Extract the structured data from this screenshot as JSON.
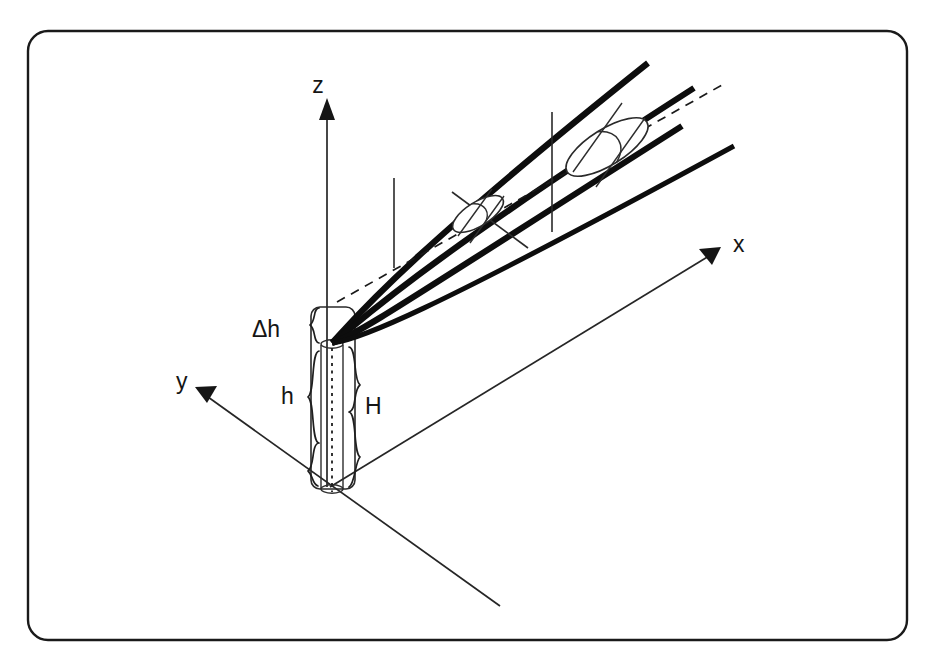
{
  "figure": {
    "background_color": "#ffffff",
    "ink_color": "#151515",
    "frame": {
      "shape": "rounded-rectangle",
      "x": 28,
      "y": 31,
      "width": 879,
      "height": 609,
      "corner_radius": 20
    },
    "axes": [
      {
        "id": "z",
        "label": "z",
        "label_x": 318,
        "label_y": 93,
        "direction": "up",
        "from": [
          327,
          487
        ],
        "to": [
          327,
          104
        ],
        "arrowhead": [
          327,
          99
        ]
      },
      {
        "id": "x",
        "label": "x",
        "label_x": 733,
        "label_y": 252,
        "direction": "up-right",
        "from": [
          330,
          487
        ],
        "to": [
          712,
          254
        ],
        "arrowhead": [
          718,
          250
        ]
      },
      {
        "id": "y",
        "label": "y",
        "label_x": 176,
        "label_y": 389,
        "direction": "up-left",
        "from": [
          500,
          606
        ],
        "to": [
          204,
          394
        ],
        "arrowhead": [
          197,
          389
        ]
      }
    ],
    "dimensions": [
      {
        "id": "delta-h",
        "label": "Δh",
        "label_x": 252,
        "label_y": 337,
        "brace_side": "left",
        "brace_x": 312,
        "span_top": 308,
        "span_bottom": 344,
        "meaning": "height increment above nozzle exit"
      },
      {
        "id": "h",
        "label": "h",
        "label_x": 281,
        "label_y": 404,
        "brace_side": "left",
        "brace_x": 312,
        "span_top": 350,
        "span_bottom": 486,
        "meaning": "lower column height"
      },
      {
        "id": "H",
        "label": "H",
        "label_x": 365,
        "label_y": 414,
        "brace_side": "right",
        "brace_x": 356,
        "span_top": 346,
        "span_bottom": 486,
        "meaning": "total column height"
      }
    ],
    "column": {
      "name": "vertical cylinder",
      "outer_left": 311,
      "outer_right": 355,
      "outer_top": 307,
      "outer_bottom": 489,
      "inner_left": 321,
      "inner_right": 343,
      "inner_top": 342,
      "inner_bottom": 489,
      "nozzle_tip": [
        332,
        343
      ],
      "centerline_x": 332
    },
    "beam": {
      "origin": [
        332,
        342
      ],
      "ray_count": 4,
      "rays": [
        {
          "id": "ray-1",
          "end": [
            648,
            63
          ]
        },
        {
          "id": "ray-2",
          "end": [
            694,
            88
          ]
        },
        {
          "id": "ray-3",
          "end": [
            682,
            126
          ]
        },
        {
          "id": "ray-4",
          "end": [
            734,
            146
          ]
        }
      ],
      "optical_axis": {
        "from": [
          337,
          302
        ],
        "to": [
          722,
          85
        ],
        "style": "dashed"
      }
    },
    "optics": [
      {
        "id": "lens-1",
        "kind": "small lens element",
        "center": [
          478,
          214
        ],
        "semi_major": 30,
        "semi_minor": 13,
        "tilt_deg": -32
      },
      {
        "id": "lens-2",
        "kind": "large lens element",
        "center": [
          607,
          147
        ],
        "semi_major": 48,
        "semi_minor": 19,
        "tilt_deg": -32
      }
    ],
    "mount_lines": [
      {
        "id": "mount-1",
        "from": [
          452,
          192
        ],
        "to": [
          528,
          248
        ]
      },
      {
        "id": "mount-2",
        "from": [
          552,
          112
        ],
        "to": [
          552,
          232
        ]
      },
      {
        "id": "mount-3",
        "from": [
          394,
          178
        ],
        "to": [
          394,
          268
        ]
      }
    ]
  }
}
